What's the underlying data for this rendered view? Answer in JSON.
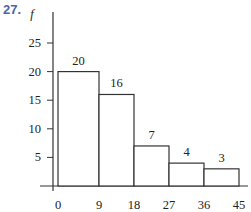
{
  "problem_number": "27.",
  "chart_data": {
    "type": "bar",
    "subtype": "histogram",
    "title": "",
    "xlabel": "",
    "ylabel": "f",
    "bin_edges": [
      0,
      9,
      18,
      27,
      36,
      45
    ],
    "categories": [
      "0-9",
      "9-18",
      "18-27",
      "27-36",
      "36-45"
    ],
    "values": [
      20,
      16,
      7,
      4,
      3
    ],
    "data_labels": [
      "20",
      "16",
      "7",
      "4",
      "3"
    ],
    "y_ticks": [
      5,
      10,
      15,
      20,
      25
    ],
    "x_ticks": [
      0,
      9,
      18,
      27,
      36,
      45
    ],
    "ylim": [
      0,
      30
    ],
    "xlim": [
      0,
      45
    ],
    "grid": false,
    "legend": null
  }
}
